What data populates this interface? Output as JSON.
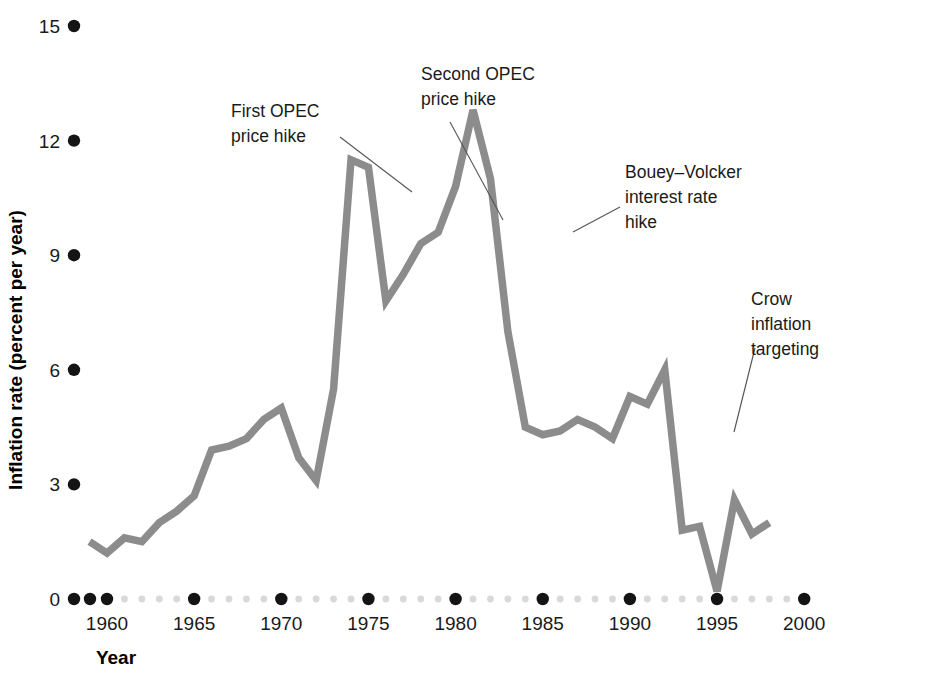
{
  "chart_data": {
    "type": "line",
    "title": "",
    "xlabel": "Year",
    "ylabel": "Inflation rate (percent per year)",
    "xlim": [
      1958,
      2001
    ],
    "ylim": [
      0,
      15
    ],
    "grid": false,
    "legend": "none",
    "series_color": "#8c8c8c",
    "x_major_ticks": [
      1960,
      1965,
      1970,
      1975,
      1980,
      1985,
      1990,
      1995,
      2000
    ],
    "x_major_tick_labels": [
      "1960",
      "1965",
      "1970",
      "1975",
      "1980",
      "1985",
      "1990",
      "1995",
      "2000"
    ],
    "y_ticks": [
      0,
      3,
      6,
      9,
      12,
      15
    ],
    "y_tick_labels": [
      "0",
      "3",
      "6",
      "9",
      "12",
      "15"
    ],
    "x": [
      1959,
      1960,
      1961,
      1962,
      1963,
      1964,
      1965,
      1966,
      1967,
      1968,
      1969,
      1970,
      1971,
      1972,
      1973,
      1974,
      1975,
      1976,
      1977,
      1978,
      1979,
      1980,
      1981,
      1982,
      1983,
      1984,
      1985,
      1986,
      1987,
      1988,
      1989,
      1990,
      1991,
      1992,
      1993,
      1994,
      1995,
      1996,
      1997,
      1998
    ],
    "values": [
      1.5,
      1.2,
      1.6,
      1.5,
      2.0,
      2.3,
      2.7,
      3.9,
      4.0,
      4.2,
      4.7,
      5.0,
      3.7,
      3.1,
      5.5,
      11.5,
      11.3,
      7.8,
      8.5,
      9.3,
      9.6,
      10.8,
      12.8,
      11.0,
      7.0,
      4.5,
      4.3,
      4.4,
      4.7,
      4.5,
      4.2,
      5.3,
      5.1,
      6.0,
      1.8,
      1.9,
      0.2,
      2.6,
      1.7,
      2.0
    ],
    "series_name": "Canadian inflation rate"
  },
  "annotations": [
    {
      "id": "first-opec",
      "lines": [
        "First OPEC",
        "price hike"
      ],
      "text_x": 231,
      "text_y": 117,
      "leader": "M 340 137 L 412 192"
    },
    {
      "id": "second-opec",
      "lines": [
        "Second OPEC",
        "price hike"
      ],
      "text_x": 421,
      "text_y": 80,
      "leader": "M 450 122 L 503 220"
    },
    {
      "id": "bouey-volcker",
      "lines": [
        "Bouey–Volcker",
        "interest rate",
        "hike"
      ],
      "text_x": 625,
      "text_y": 178,
      "leader": "M 620 207 L 573 232"
    },
    {
      "id": "crow-inflation-targeting",
      "lines": [
        "Crow",
        "inflation",
        "targeting"
      ],
      "text_x": 751,
      "text_y": 305,
      "leader": "M 755 348 L 734 432"
    }
  ],
  "axis": {
    "x_title": "Year",
    "y_title": "Inflation rate (percent per year)"
  },
  "colors": {
    "series": "#8c8c8c",
    "major_dot": "#141414",
    "minor_dot": "#d9d9d9",
    "text": "#1a1a1a",
    "leader": "#555555",
    "background": "#ffffff"
  }
}
